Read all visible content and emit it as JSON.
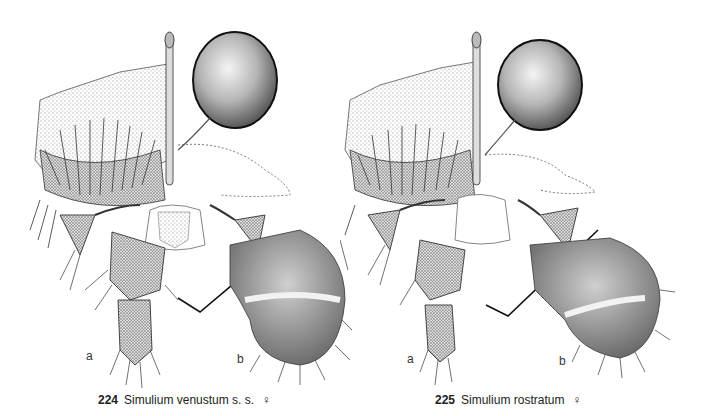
{
  "plate": {
    "figures": [
      {
        "number": "224",
        "species": "Simulium venustum s. s.",
        "sex_symbol": "♀",
        "panels": [
          {
            "label": "a"
          },
          {
            "label": "b"
          }
        ]
      },
      {
        "number": "225",
        "species": "Simulium rostratum",
        "sex_symbol": "♀",
        "panels": [
          {
            "label": "a"
          },
          {
            "label": "b"
          }
        ]
      }
    ]
  },
  "colors": {
    "ink": "#222222",
    "stipple": "#7a7a7a",
    "background": "#ffffff"
  }
}
